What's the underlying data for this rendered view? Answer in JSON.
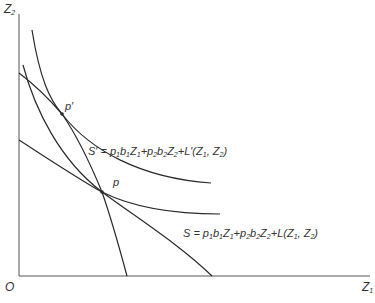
{
  "axes": {
    "y_label": "Z",
    "y_sub": "2",
    "x_label": "Z",
    "x_sub": "1",
    "origin": "O"
  },
  "points": {
    "p_prime": "p′",
    "p": "p"
  },
  "equations": {
    "s_prime": {
      "lhs": "S′ = ",
      "text": "p1b1Z1+p2b2Z2+L′(Z1, Z2)"
    },
    "s": {
      "lhs": "S = ",
      "text": "p1b1Z1+p2b2Z2+L(Z1, Z2)"
    }
  },
  "colors": {
    "line": "#2a2a2a",
    "axis": "#555555",
    "text": "#333333"
  }
}
